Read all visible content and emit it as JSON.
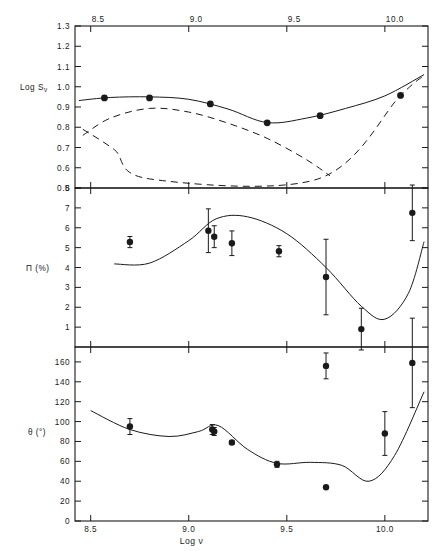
{
  "figure": {
    "title_fragment": "",
    "xlabel": "Log ν",
    "x_ticks": [
      {
        "value": 8.5,
        "label": "8.5"
      },
      {
        "value": 9.0,
        "label": "9.0"
      },
      {
        "value": 9.5,
        "label": "9.5"
      },
      {
        "value": 10.0,
        "label": "10.0"
      }
    ],
    "xlim": [
      8.42,
      10.22
    ],
    "ink": "#1a1a1a"
  },
  "chart_data": [
    {
      "type": "scatter",
      "panel": "top",
      "title": "",
      "xlabel": "Log ν",
      "ylabel": "Log Sν",
      "ylim": [
        0.5,
        1.3
      ],
      "xlim": [
        8.42,
        10.22
      ],
      "grid": false,
      "legend": "none",
      "y_ticks": [
        {
          "value": 1.3,
          "label": "1.3"
        },
        {
          "value": 1.2,
          "label": "1.2"
        },
        {
          "value": 1.1,
          "label": "1.1"
        },
        {
          "value": 1.0,
          "label": "1.0"
        },
        {
          "value": 0.9,
          "label": "0.9"
        },
        {
          "value": 0.8,
          "label": "0.8"
        },
        {
          "value": 0.7,
          "label": "0.7"
        },
        {
          "value": 0.6,
          "label": "0.6"
        },
        {
          "value": 0.5,
          "label": "0.5"
        }
      ],
      "x": [
        8.57,
        8.8,
        9.11,
        9.4,
        9.67,
        10.08
      ],
      "y": [
        0.945,
        0.945,
        0.915,
        0.822,
        0.857,
        0.957
      ],
      "yerr": [
        0,
        0,
        0,
        0,
        0,
        0
      ],
      "series": [
        {
          "name": "model total (solid)",
          "style": "solid",
          "x": [
            8.44,
            8.6,
            8.8,
            9.0,
            9.2,
            9.4,
            9.6,
            9.8,
            10.0,
            10.2
          ],
          "values": [
            0.932,
            0.947,
            0.95,
            0.938,
            0.89,
            0.823,
            0.845,
            0.893,
            0.955,
            1.06
          ]
        },
        {
          "name": "component A (dashed, falling)",
          "style": "dashed",
          "x": [
            8.46,
            8.6,
            8.8,
            9.0,
            9.2,
            9.4,
            9.6,
            9.72
          ],
          "values": [
            0.76,
            0.845,
            0.893,
            0.875,
            0.82,
            0.745,
            0.64,
            0.56
          ]
        },
        {
          "name": "component B (dashed, rising)",
          "style": "dashed",
          "x": [
            8.46,
            8.62,
            8.8,
            9.66,
            10.08,
            10.2
          ],
          "values": [
            0.79,
            0.69,
            0.545,
            0.545,
            0.957,
            1.055
          ]
        }
      ]
    },
    {
      "type": "scatter",
      "panel": "middle",
      "title": "",
      "xlabel": "Log ν",
      "ylabel": "Π (%)",
      "ylim": [
        0,
        8
      ],
      "xlim": [
        8.42,
        10.22
      ],
      "grid": false,
      "legend": "none",
      "y_ticks": [
        {
          "value": 8,
          "label": "8"
        },
        {
          "value": 7,
          "label": "7"
        },
        {
          "value": 6,
          "label": "6"
        },
        {
          "value": 5,
          "label": "5"
        },
        {
          "value": 4,
          "label": "4"
        },
        {
          "value": 3,
          "label": "3"
        },
        {
          "value": 2,
          "label": "2"
        },
        {
          "value": 1,
          "label": "1"
        }
      ],
      "x": [
        8.7,
        9.1,
        9.13,
        9.22,
        9.46,
        9.7,
        9.88,
        10.14
      ],
      "y": [
        5.28,
        5.85,
        5.55,
        5.22,
        4.82,
        3.52,
        0.9,
        6.75
      ],
      "yerr": [
        0.28,
        1.1,
        0.55,
        0.62,
        0.28,
        1.9,
        1.05,
        1.4
      ],
      "series": [
        {
          "name": "model (solid)",
          "style": "solid",
          "x": [
            8.62,
            8.8,
            9.0,
            9.14,
            9.3,
            9.5,
            9.7,
            9.88,
            10.0,
            10.12,
            10.2
          ],
          "values": [
            4.18,
            4.22,
            5.35,
            6.45,
            6.55,
            5.7,
            4.0,
            2.05,
            1.4,
            2.7,
            5.3
          ]
        }
      ]
    },
    {
      "type": "scatter",
      "panel": "bottom",
      "title": "",
      "xlabel": "Log ν",
      "ylabel": "θ (°)",
      "ylim": [
        0,
        175
      ],
      "xlim": [
        8.42,
        10.22
      ],
      "grid": false,
      "legend": "none",
      "y_ticks": [
        {
          "value": 160,
          "label": "160"
        },
        {
          "value": 140,
          "label": "140"
        },
        {
          "value": 120,
          "label": "120"
        },
        {
          "value": 100,
          "label": "100"
        },
        {
          "value": 80,
          "label": "80"
        },
        {
          "value": 60,
          "label": "60"
        },
        {
          "value": 40,
          "label": "40"
        },
        {
          "value": 20,
          "label": "20"
        },
        {
          "value": 0,
          "label": "0"
        }
      ],
      "x": [
        8.7,
        9.12,
        9.13,
        9.22,
        9.45,
        9.7,
        9.7,
        10.0,
        10.14
      ],
      "y": [
        95,
        92,
        90,
        79,
        57,
        156,
        34,
        88,
        159
      ],
      "yerr": [
        8,
        5,
        4,
        2,
        3,
        13,
        0,
        22,
        45
      ],
      "series": [
        {
          "name": "model (solid)",
          "style": "solid",
          "x": [
            8.5,
            8.7,
            8.9,
            9.05,
            9.15,
            9.3,
            9.45,
            9.62,
            9.78,
            9.92,
            10.05,
            10.2
          ],
          "values": [
            111,
            92,
            85,
            90,
            96,
            72,
            58,
            59,
            56,
            40,
            66,
            130
          ]
        }
      ]
    }
  ]
}
